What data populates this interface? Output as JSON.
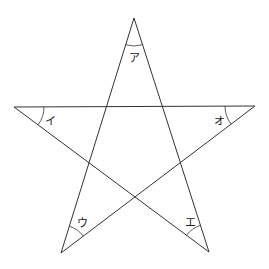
{
  "diagram": {
    "type": "pentagram",
    "angles": [
      {
        "id": "top",
        "label": "ア"
      },
      {
        "id": "left",
        "label": "イ"
      },
      {
        "id": "bottom-left",
        "label": "ウ"
      },
      {
        "id": "bottom-right",
        "label": "エ"
      },
      {
        "id": "right",
        "label": "オ"
      }
    ]
  }
}
